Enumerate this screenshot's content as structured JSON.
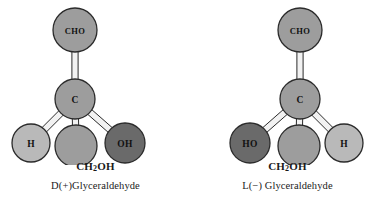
{
  "figure": {
    "background_color": "#ffffff",
    "type": "ball-and-stick stereochemistry diagram"
  },
  "palette": {
    "sphere_light": "#b9b9b9",
    "sphere_medium": "#9d9d9d",
    "sphere_dark": "#6a6a6a",
    "sphere_outline": "#2b2b2b",
    "bond_fill": "#f2f2f2",
    "bond_outline": "#2b2b2b",
    "text_color": "#1a1a1a"
  },
  "molecules": [
    {
      "id": "d-glyceraldehyde",
      "formula_label": "CH",
      "formula_sub": "2",
      "formula_tail": "OH",
      "name_label": "D(+)Glyceraldehyde",
      "atoms": [
        {
          "key": "top",
          "label": "CHO",
          "shade": "medium",
          "cx": 75,
          "cy": 30,
          "r": 22
        },
        {
          "key": "center",
          "label": "C",
          "shade": "medium",
          "cx": 75,
          "cy": 99,
          "r": 20
        },
        {
          "key": "left",
          "label": "H",
          "shade": "light",
          "cx": 31,
          "cy": 143,
          "r": 19
        },
        {
          "key": "bottom",
          "label": "",
          "shade": "medium",
          "cx": 76,
          "cy": 146,
          "r": 21
        },
        {
          "key": "right",
          "label": "OH",
          "shade": "dark",
          "cx": 125,
          "cy": 143,
          "r": 20
        }
      ],
      "bonds": [
        {
          "from": "center",
          "to": "top"
        },
        {
          "from": "center",
          "to": "bottom"
        },
        {
          "from": "center",
          "to": "left"
        },
        {
          "from": "center",
          "to": "right"
        }
      ]
    },
    {
      "id": "l-glyceraldehyde",
      "formula_label": "CH",
      "formula_sub": "2",
      "formula_tail": "OH",
      "name_label": "L(−) Glyceraldehyde",
      "atoms": [
        {
          "key": "top",
          "label": "CHO",
          "shade": "medium",
          "cx": 108,
          "cy": 30,
          "r": 22
        },
        {
          "key": "center",
          "label": "C",
          "shade": "medium",
          "cx": 108,
          "cy": 99,
          "r": 20
        },
        {
          "key": "left",
          "label": "HO",
          "shade": "dark",
          "cx": 58,
          "cy": 143,
          "r": 20
        },
        {
          "key": "bottom",
          "label": "",
          "shade": "medium",
          "cx": 107,
          "cy": 146,
          "r": 21
        },
        {
          "key": "right",
          "label": "H",
          "shade": "light",
          "cx": 152,
          "cy": 143,
          "r": 19
        }
      ],
      "bonds": [
        {
          "from": "center",
          "to": "top"
        },
        {
          "from": "center",
          "to": "bottom"
        },
        {
          "from": "center",
          "to": "left"
        },
        {
          "from": "center",
          "to": "right"
        }
      ]
    }
  ]
}
